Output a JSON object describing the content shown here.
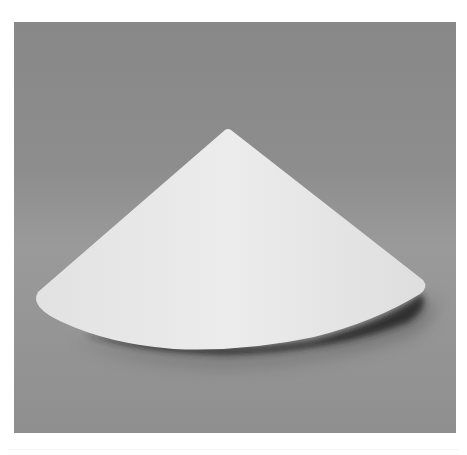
{
  "image": {
    "subject": "white-cone",
    "description": "A white paper cone resting on a gray surface with a soft shadow beneath its right side",
    "background_color": "#8c8c8c",
    "object_color": "#e6e6e6",
    "shadow_color": "#2a2a2a"
  }
}
